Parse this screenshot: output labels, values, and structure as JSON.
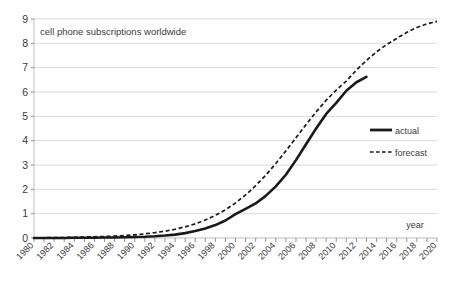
{
  "chart_data": {
    "type": "line",
    "title": "cell phone subscriptions worldwide",
    "xlabel": "year",
    "ylabel": "",
    "xlim": [
      1980,
      2020
    ],
    "ylim": [
      0,
      9
    ],
    "grid": true,
    "legend_position": "right-middle",
    "ytick_labels": [
      "0",
      "1",
      "2",
      "3",
      "4",
      "5",
      "6",
      "7",
      "8",
      "9"
    ],
    "ytick_values": [
      0,
      1,
      2,
      3,
      4,
      5,
      6,
      7,
      8,
      9
    ],
    "xtick_labels": [
      "1980",
      "1982",
      "1984",
      "1986",
      "1988",
      "1990",
      "1992",
      "1994",
      "1996",
      "1998",
      "2000",
      "2002",
      "2004",
      "2006",
      "2008",
      "2010",
      "2012",
      "2014",
      "2016",
      "2018",
      "2020"
    ],
    "xtick_values": [
      1980,
      1982,
      1984,
      1986,
      1988,
      1990,
      1992,
      1994,
      1996,
      1998,
      2000,
      2002,
      2004,
      2006,
      2008,
      2010,
      2012,
      2014,
      2016,
      2018,
      2020
    ],
    "x": [
      1980,
      1981,
      1982,
      1983,
      1984,
      1985,
      1986,
      1987,
      1988,
      1989,
      1990,
      1991,
      1992,
      1993,
      1994,
      1995,
      1996,
      1997,
      1998,
      1999,
      2000,
      2001,
      2002,
      2003,
      2004,
      2005,
      2006,
      2007,
      2008,
      2009,
      2010,
      2011,
      2012,
      2013,
      2014,
      2015,
      2016,
      2017,
      2018,
      2019,
      2020
    ],
    "series": [
      {
        "name": "actual",
        "style": "solid",
        "x": [
          1980,
          1981,
          1982,
          1983,
          1984,
          1985,
          1986,
          1987,
          1988,
          1989,
          1990,
          1991,
          1992,
          1993,
          1994,
          1995,
          1996,
          1997,
          1998,
          1999,
          2000,
          2001,
          2002,
          2003,
          2004,
          2005,
          2006,
          2007,
          2008,
          2009,
          2010,
          2011,
          2012,
          2013
        ],
        "values": [
          0.0,
          0.0,
          0.0,
          0.0,
          0.01,
          0.01,
          0.01,
          0.02,
          0.02,
          0.03,
          0.04,
          0.05,
          0.07,
          0.1,
          0.14,
          0.2,
          0.29,
          0.39,
          0.53,
          0.72,
          0.98,
          1.2,
          1.42,
          1.73,
          2.12,
          2.6,
          3.2,
          3.85,
          4.5,
          5.1,
          5.55,
          6.05,
          6.4,
          6.62
        ]
      },
      {
        "name": "forecast",
        "style": "dashed",
        "x": [
          1980,
          1981,
          1982,
          1983,
          1984,
          1985,
          1986,
          1987,
          1988,
          1989,
          1990,
          1991,
          1992,
          1993,
          1994,
          1995,
          1996,
          1997,
          1998,
          1999,
          2000,
          2001,
          2002,
          2003,
          2004,
          2005,
          2006,
          2007,
          2008,
          2009,
          2010,
          2011,
          2012,
          2013,
          2014,
          2015,
          2016,
          2017,
          2018,
          2019,
          2020
        ],
        "values": [
          0.01,
          0.01,
          0.02,
          0.02,
          0.03,
          0.04,
          0.05,
          0.06,
          0.08,
          0.1,
          0.13,
          0.17,
          0.22,
          0.28,
          0.36,
          0.46,
          0.58,
          0.74,
          0.93,
          1.16,
          1.44,
          1.77,
          2.15,
          2.58,
          3.06,
          3.58,
          4.12,
          4.66,
          5.18,
          5.66,
          6.08,
          6.45,
          6.9,
          7.3,
          7.65,
          7.95,
          8.2,
          8.45,
          8.65,
          8.8,
          8.9
        ]
      }
    ],
    "legend": [
      {
        "label": "actual",
        "style": "solid"
      },
      {
        "label": "forecast",
        "style": "dashed"
      }
    ]
  },
  "colors": {
    "series": "#1a1a1a",
    "grid": "#d0d0d0",
    "axis": "#b5b5b5",
    "text": "#3b3b3b",
    "background": "#ffffff"
  }
}
